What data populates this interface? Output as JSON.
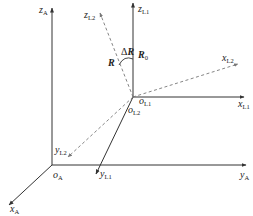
{
  "diagram": {
    "type": "coordinate-frames",
    "colors": {
      "solid_axis": "#333333",
      "dashed_axis": "#888888",
      "text": "#222222",
      "background": "#ffffff"
    },
    "frame_A": {
      "origin": {
        "base": "o",
        "sub": "A"
      },
      "axes": {
        "x": {
          "base": "x",
          "sub": "A"
        },
        "y": {
          "base": "y",
          "sub": "A"
        },
        "z": {
          "base": "z",
          "sub": "A"
        }
      }
    },
    "frame_L1": {
      "origin": {
        "base": "o",
        "sub": "L1"
      },
      "axes": {
        "x": {
          "base": "x",
          "sub": "L1"
        },
        "y": {
          "base": "y",
          "sub": "L1"
        },
        "z": {
          "base": "z",
          "sub": "L1"
        }
      }
    },
    "frame_L2": {
      "style": "dashed",
      "origin": {
        "base": "o",
        "sub": "L2"
      },
      "axes": {
        "x": {
          "base": "x",
          "sub": "L2"
        },
        "y": {
          "base": "y",
          "sub": "L2"
        },
        "z": {
          "base": "z",
          "sub": "L2"
        }
      }
    },
    "vectors": {
      "R": "R",
      "R0": {
        "base": "R",
        "sub": "0"
      },
      "delta_R": {
        "delta": "Δ",
        "base": "R"
      }
    }
  }
}
